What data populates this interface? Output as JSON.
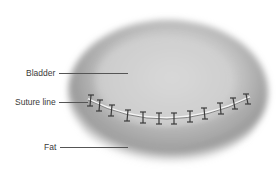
{
  "diagram": {
    "labels": [
      {
        "id": "bladder",
        "text": "Bladder"
      },
      {
        "id": "suture-line",
        "text": "Suture line"
      },
      {
        "id": "fat",
        "text": "Fat"
      }
    ],
    "stitch_count": 12,
    "colors": {
      "organ_light": "#d8d8d8",
      "organ_dark": "#8a8a8a",
      "suture": "#3d3d3d",
      "label_text": "#3a3a3a"
    }
  }
}
